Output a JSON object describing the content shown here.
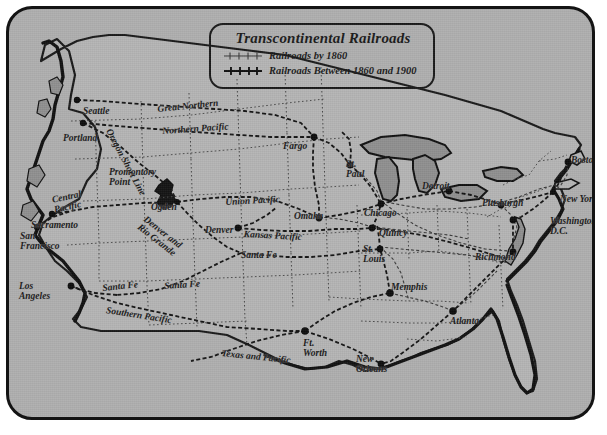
{
  "figure": {
    "kind": "historical-map",
    "region": "United States",
    "background_color": "#aeaeae",
    "ink_color": "#1a1a1a",
    "water_color": "#8f8f8f"
  },
  "legend": {
    "title": "Transcontinental Railroads",
    "entries": [
      {
        "label": "Railroads by 1860",
        "style": "thin-hatched",
        "color": "#2a2a2a"
      },
      {
        "label": "Railroads Between 1860 and 1900",
        "style": "bold-hatched",
        "color": "#111111"
      }
    ]
  },
  "cities": [
    {
      "name": "Seattle",
      "x": 74,
      "y": 97,
      "dot_x": 68,
      "dot_y": 91,
      "align": "left"
    },
    {
      "name": "Portland",
      "x": 54,
      "y": 124,
      "dot_x": 74,
      "dot_y": 114,
      "align": "left"
    },
    {
      "name": "Sacramento",
      "x": 22,
      "y": 211,
      "dot_x": 43,
      "dot_y": 205,
      "align": "left"
    },
    {
      "name": "San\nFrancisco",
      "x": 11,
      "y": 222,
      "dot_x": 28,
      "dot_y": 218,
      "align": "left"
    },
    {
      "name": "Los\nAngeles",
      "x": 10,
      "y": 272,
      "dot_x": 62,
      "dot_y": 277,
      "align": "left"
    },
    {
      "name": "Ogden",
      "x": 142,
      "y": 193,
      "dot_x": 168,
      "dot_y": 193,
      "align": "left"
    },
    {
      "name": "Denver",
      "x": 196,
      "y": 216,
      "dot_x": 229,
      "dot_y": 219,
      "align": "left"
    },
    {
      "name": "Fargo",
      "x": 274,
      "y": 132,
      "dot_x": 305,
      "dot_y": 128,
      "align": "left"
    },
    {
      "name": "St.\nPaul",
      "x": 337,
      "y": 150,
      "dot_x": 341,
      "dot_y": 156,
      "align": "left"
    },
    {
      "name": "Omaha",
      "x": 285,
      "y": 202,
      "dot_x": 310,
      "dot_y": 209,
      "align": "left"
    },
    {
      "name": "Chicago",
      "x": 355,
      "y": 199,
      "dot_x": 372,
      "dot_y": 195,
      "align": "left"
    },
    {
      "name": "Quincy",
      "x": 370,
      "y": 219,
      "dot_x": 363,
      "dot_y": 219,
      "align": "left"
    },
    {
      "name": "St.\nLouis",
      "x": 354,
      "y": 235,
      "dot_x": 371,
      "dot_y": 240,
      "align": "left"
    },
    {
      "name": "Detroit",
      "x": 413,
      "y": 172,
      "dot_x": 440,
      "dot_y": 182,
      "align": "left"
    },
    {
      "name": "Pittsburgh",
      "x": 473,
      "y": 189,
      "dot_x": 492,
      "dot_y": 196,
      "align": "left"
    },
    {
      "name": "Boston",
      "x": 562,
      "y": 146,
      "dot_x": 559,
      "dot_y": 153,
      "align": "left"
    },
    {
      "name": "New York",
      "x": 551,
      "y": 185,
      "dot_x": 544,
      "dot_y": 183,
      "align": "left"
    },
    {
      "name": "Washington,\nD.C.",
      "x": 541,
      "y": 207,
      "dot_x": 510,
      "dot_y": 211,
      "align": "left"
    },
    {
      "name": "Richmond",
      "x": 466,
      "y": 243,
      "dot_x": 504,
      "dot_y": 243,
      "align": "left"
    },
    {
      "name": "Memphis",
      "x": 382,
      "y": 273,
      "dot_x": 381,
      "dot_y": 284,
      "align": "left"
    },
    {
      "name": "Atlanta",
      "x": 441,
      "y": 307,
      "dot_x": 444,
      "dot_y": 302,
      "align": "left"
    },
    {
      "name": "Ft.\nWorth",
      "x": 294,
      "y": 329,
      "dot_x": 296,
      "dot_y": 322,
      "align": "left"
    },
    {
      "name": "New\nOrleans",
      "x": 347,
      "y": 345,
      "dot_x": 372,
      "dot_y": 355,
      "align": "left"
    },
    {
      "name": "Promontory\nPoint",
      "x": 100,
      "y": 158,
      "dot_x": 0,
      "dot_y": 0,
      "align": "left"
    }
  ],
  "rail_lines": [
    {
      "name": "Great Northern",
      "x": 148,
      "y": 95,
      "rotate": -6
    },
    {
      "name": "Northern Pacific",
      "x": 153,
      "y": 117,
      "rotate": -4
    },
    {
      "name": "Oregon Short Line",
      "x": 104,
      "y": 118,
      "rotate": 62
    },
    {
      "name": "Central\nPacific",
      "x": 42,
      "y": 186,
      "rotate": -12
    },
    {
      "name": "Union Pacific",
      "x": 216,
      "y": 188,
      "rotate": -3
    },
    {
      "name": "Kansas Pacific",
      "x": 235,
      "y": 220,
      "rotate": 3
    },
    {
      "name": "Denver and\nRio Grande",
      "x": 139,
      "y": 205,
      "rotate": 38
    },
    {
      "name": "Santa Fe",
      "x": 232,
      "y": 241,
      "rotate": 0
    },
    {
      "name": "Santa Fe",
      "x": 93,
      "y": 274,
      "rotate": -6
    },
    {
      "name": "Santa Fe",
      "x": 155,
      "y": 272,
      "rotate": -4
    },
    {
      "name": "Southern Pacific",
      "x": 98,
      "y": 296,
      "rotate": 9
    },
    {
      "name": "Texas and Pacific",
      "x": 213,
      "y": 339,
      "rotate": 6
    }
  ]
}
